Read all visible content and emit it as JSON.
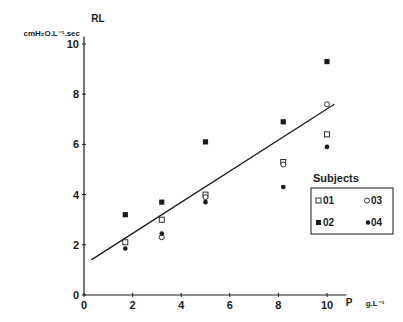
{
  "chart_data": {
    "type": "scatter",
    "title": "",
    "ylabel": "RL",
    "ylabel_units": "cmH2O.L-1.sec",
    "xlabel": "P",
    "xlabel_units": "g.L-1",
    "xlim": [
      0,
      10.5
    ],
    "ylim": [
      0,
      10
    ],
    "x_ticks": [
      0,
      2,
      4,
      6,
      8,
      10
    ],
    "y_ticks": [
      0,
      2,
      4,
      6,
      8,
      10
    ],
    "grid": false,
    "legend_title": "Subjects",
    "legend_position": "right",
    "series": [
      {
        "name": "01",
        "marker": "open-square",
        "points": [
          [
            1.7,
            2.1
          ],
          [
            3.2,
            3.0
          ],
          [
            5.0,
            4.0
          ],
          [
            8.2,
            5.3
          ],
          [
            10.0,
            6.4
          ]
        ]
      },
      {
        "name": "02",
        "marker": "filled-square",
        "points": [
          [
            1.7,
            3.2
          ],
          [
            3.2,
            3.7
          ],
          [
            5.0,
            6.1
          ],
          [
            8.2,
            6.9
          ],
          [
            10.0,
            9.3
          ]
        ]
      },
      {
        "name": "03",
        "marker": "open-circle",
        "points": [
          [
            3.2,
            2.3
          ],
          [
            5.0,
            3.9
          ],
          [
            8.2,
            5.2
          ],
          [
            10.0,
            7.6
          ]
        ]
      },
      {
        "name": "04",
        "marker": "filled-circle",
        "points": [
          [
            1.7,
            1.85
          ],
          [
            3.2,
            2.45
          ],
          [
            5.0,
            3.7
          ],
          [
            8.2,
            4.3
          ],
          [
            10.0,
            5.9
          ]
        ]
      }
    ],
    "regression_line": {
      "x": [
        0.3,
        10.3
      ],
      "y": [
        1.4,
        7.6
      ]
    }
  },
  "labels": {
    "y_title": "RL",
    "y_units": "cmH₂O.L⁻¹.sec",
    "x_title": "P",
    "x_units": "g.L⁻¹",
    "legend_title": "Subjects",
    "legend_01": "01",
    "legend_02": "02",
    "legend_03": "03",
    "legend_04": "04",
    "ticks_x": [
      "0",
      "2",
      "4",
      "6",
      "8",
      "10"
    ],
    "ticks_y": [
      "0",
      "2",
      "4",
      "6",
      "8",
      "10"
    ]
  }
}
